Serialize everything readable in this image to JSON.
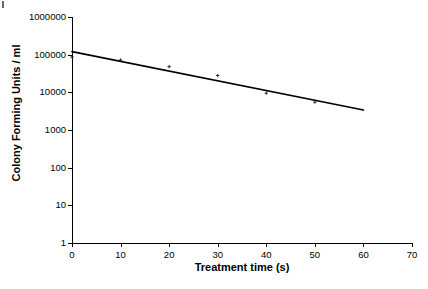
{
  "chart_data": {
    "type": "scatter",
    "title": "",
    "xlabel": "Treatment time (s)",
    "ylabel": "Colony Forming Units / ml",
    "xlim": [
      0,
      70
    ],
    "ylim": [
      1,
      1000000
    ],
    "yscale": "log",
    "grid": false,
    "legend": null,
    "x_ticks": [
      0,
      10,
      20,
      30,
      40,
      50,
      60,
      70
    ],
    "x_tick_labels": [
      "0",
      "10",
      "20",
      "30",
      "40",
      "50",
      "60",
      "70"
    ],
    "y_ticks": [
      1,
      10,
      100,
      1000,
      10000,
      100000,
      1000000
    ],
    "y_tick_labels": [
      "1",
      "10",
      "100",
      "1000",
      "10000",
      "100000",
      "1000000"
    ],
    "series": [
      {
        "name": "Colony Forming Units",
        "marker": "small-cross",
        "x": [
          0,
          10,
          20,
          30,
          40,
          50
        ],
        "values": [
          87000,
          72000,
          48000,
          28000,
          9500,
          5500
        ]
      },
      {
        "name": "Trend line",
        "type": "line",
        "x": [
          0,
          60
        ],
        "values": [
          120000,
          3400
        ]
      }
    ],
    "colors": {
      "marker": "#1a1a1a",
      "line": "#000000",
      "axis": "#000000",
      "background": "#ffffff"
    }
  },
  "figure": {
    "background_color": "#ffffff",
    "axis_color": "#000000"
  }
}
